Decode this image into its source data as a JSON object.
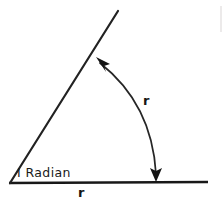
{
  "figure": {
    "background_color": "#ffffff",
    "stroke_color": "#1a1a1a",
    "labels": {
      "angle": "I Radian",
      "radius_arc": "r",
      "radius_base": "r"
    },
    "icons": {
      "arrowhead_upper": "arrowhead-up-left-icon",
      "arrowhead_lower": "arrowhead-down-icon"
    },
    "geometry": {
      "vertex": [
        10,
        183
      ],
      "baseline_end": [
        208,
        182
      ],
      "ray_end": [
        118,
        11
      ],
      "arc_start": [
        99,
        62
      ],
      "arc_end": [
        156,
        176
      ],
      "arc_control": [
        152,
        104
      ],
      "angle_measure": "1 radian"
    }
  }
}
